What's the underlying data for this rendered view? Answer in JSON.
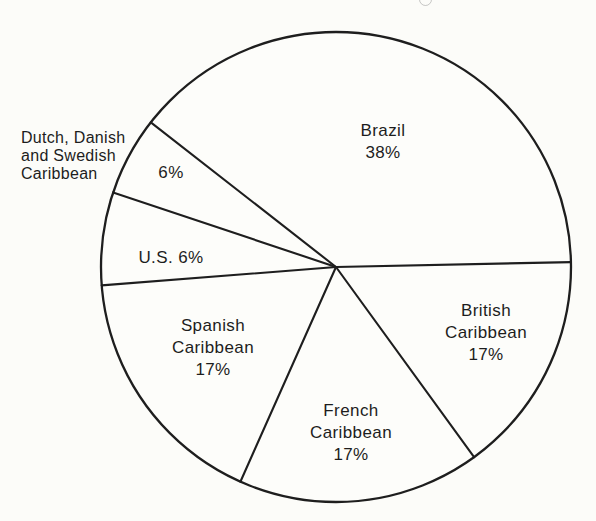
{
  "chart_data": {
    "type": "pie",
    "title": "",
    "unit": "percent",
    "slices": [
      {
        "name": "Brazil",
        "value": 38,
        "label_lines": [
          "Brazil",
          "38%"
        ],
        "label_position": "inside"
      },
      {
        "name": "Dutch, Danish and Swedish Caribbean",
        "value": 6,
        "label_lines": [
          "6%"
        ],
        "name_lines": [
          "Dutch, Danish",
          "and Swedish",
          "Caribbean"
        ],
        "label_position": "outside-left"
      },
      {
        "name": "U.S.",
        "value": 6,
        "label_lines": [
          "U.S. 6%"
        ],
        "label_position": "inside"
      },
      {
        "name": "Spanish Caribbean",
        "value": 17,
        "label_lines": [
          "Spanish",
          "Caribbean",
          "17%"
        ],
        "label_position": "inside"
      },
      {
        "name": "French Caribbean",
        "value": 17,
        "label_lines": [
          "French",
          "Caribbean",
          "17%"
        ],
        "label_position": "inside"
      },
      {
        "name": "British Caribbean",
        "value": 17,
        "label_lines": [
          "British",
          "Caribbean",
          "17%"
        ],
        "label_position": "inside"
      }
    ],
    "layout": {
      "direction": "counterclockwise",
      "boundary_angles_deg": [
        1.2,
        142,
        161.5,
        184.5,
        246,
        306
      ],
      "center_x": 336,
      "center_y": 267,
      "radius_px": 235,
      "stroke_color": "#1e1e1e",
      "fill_color": "#fdfdfa",
      "legend": "none",
      "grid": false
    }
  }
}
